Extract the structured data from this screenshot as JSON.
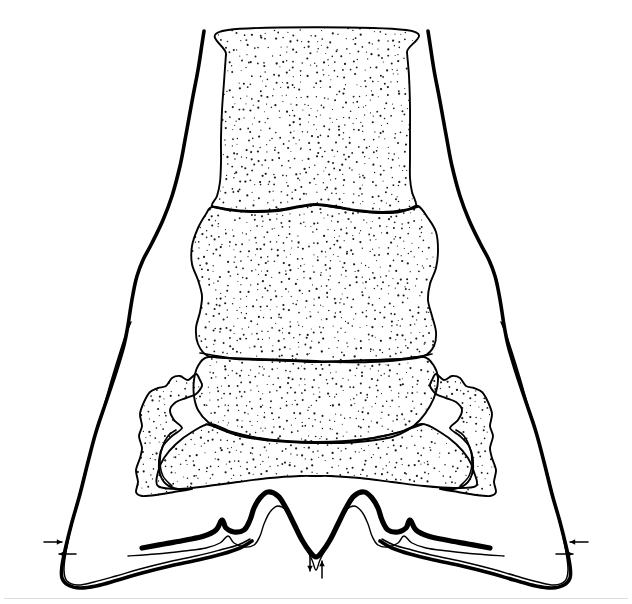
{
  "figure": {
    "domain_note": "scientific illustration, bilaterally symmetric, black ink line art with stipple shading on white ground",
    "canvas": {
      "width": 632,
      "height": 604,
      "background": "#ffffff"
    },
    "colors": {
      "ink": "#000000",
      "background": "#ffffff",
      "stipple_dot": "#1a1a1a",
      "stipple_fill": "#ffffff",
      "artifact_line": "#d8d8d8"
    },
    "line_weights": {
      "outer_contour": 3.6,
      "bottom_basin_thick": 5.2,
      "inner_wedge": 1.5,
      "organ_outline": 1.9,
      "segment_divider": 1.7,
      "thin_basin": 1.4,
      "arrow": 1.5
    }
  },
  "structures": {
    "vertebral_column": {
      "name": "vertebral-column",
      "segment_count": 3,
      "fill": "stipple",
      "segments": [
        {
          "label": "cranial-vertebral-segment",
          "order": 1,
          "top_y": 30,
          "bottom_y": 208
        },
        {
          "label": "middle-vertebral-segment",
          "order": 2,
          "top_y": 208,
          "bottom_y": 356
        },
        {
          "label": "caudal-vertebral-segment",
          "order": 3,
          "top_y": 356,
          "bottom_y": 440
        }
      ]
    },
    "sacral_wings": {
      "name": "sacral-wing",
      "count": 2,
      "sides": [
        "left",
        "right"
      ],
      "fill": "stipple",
      "top_y": 372,
      "bottom_y": 495
    },
    "basin": {
      "name": "pelvic-basin-contour",
      "shape": "double-peaked M curve",
      "peak_count": 2,
      "thick_line": true,
      "paired_thin_line": true,
      "lowest_point_y": 557
    },
    "lateral_wedges": {
      "name": "lateral-wedge",
      "count": 2,
      "sides": [
        "left",
        "right"
      ],
      "description": "narrow elongate sliver between outer contour and inner line"
    },
    "outer_contour": {
      "name": "outer-body-contour",
      "description": "thick tapering flared outline descending from top to lower corners"
    }
  },
  "markers": [
    {
      "id": "marker-left-lateral",
      "name": "left-lateral-measurement-arrows",
      "type": "opposed-arrow-pair",
      "orientation": "horizontal",
      "arrow_count": 2,
      "x": 60,
      "y": 546
    },
    {
      "id": "marker-center-bottom",
      "name": "center-thickness-measurement-arrows",
      "type": "opposed-arrow-pair",
      "orientation": "vertical",
      "arrow_count": 2,
      "x": 316,
      "y": 565
    },
    {
      "id": "marker-right-lateral",
      "name": "right-lateral-measurement-arrows",
      "type": "opposed-arrow-pair",
      "orientation": "horizontal",
      "arrow_count": 2,
      "x": 572,
      "y": 546
    }
  ],
  "stipple": {
    "name": "stipple-texture",
    "dot_radius_min": 0.5,
    "dot_radius_max": 1.15,
    "spacing": 7.0,
    "jitter": 3.0,
    "seed": 20240613
  },
  "labels": {
    "none_present": "This figure contains no visible text, axis ticks, legend, caption or numeric labels."
  }
}
